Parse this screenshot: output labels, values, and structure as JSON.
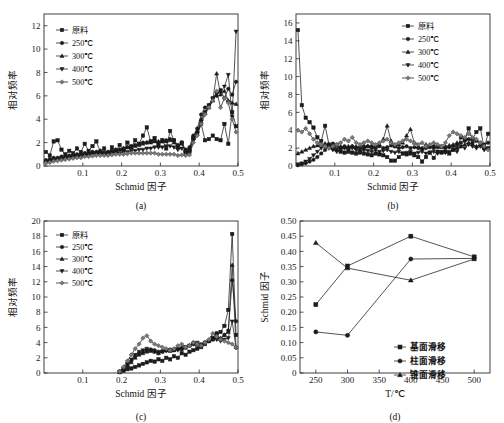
{
  "figure": {
    "panels": [
      "a",
      "b",
      "c",
      "d"
    ],
    "tags": {
      "a": "(a)",
      "b": "(b)",
      "c": "(c)",
      "d": "(d)"
    }
  },
  "labels": {
    "y_freq": "相对频率",
    "x_schmid": "Schmid 因子",
    "y_schmid": "Schmid 因子",
    "x_temp": "T/℃"
  },
  "legend_temp": [
    {
      "label": "原料",
      "marker": "square"
    },
    {
      "label": "250℃",
      "marker": "circle"
    },
    {
      "label": "300℃",
      "marker": "triangle"
    },
    {
      "label": "400℃",
      "marker": "down-triangle"
    },
    {
      "label": "500℃",
      "marker": "diamond"
    }
  ],
  "legend_slip": [
    {
      "label": "基面滑移",
      "marker": "square"
    },
    {
      "label": "柱面滑移",
      "marker": "circle"
    },
    {
      "label": "锥面滑移",
      "marker": "triangle"
    }
  ],
  "chart_data": [
    {
      "panel": "a",
      "type": "line",
      "title": "",
      "xlabel": "Schmid 因子",
      "ylabel": "相对频率",
      "xlim": [
        0,
        0.5
      ],
      "ylim": [
        0,
        13
      ],
      "xticks": [
        0.1,
        0.2,
        0.3,
        0.4,
        0.5
      ],
      "yticks": [
        0,
        2,
        4,
        6,
        8,
        10,
        12
      ],
      "grid": false,
      "legend_position": "top-left",
      "x": [
        0.005,
        0.015,
        0.025,
        0.035,
        0.045,
        0.055,
        0.065,
        0.075,
        0.085,
        0.095,
        0.105,
        0.115,
        0.125,
        0.135,
        0.145,
        0.155,
        0.165,
        0.175,
        0.185,
        0.195,
        0.205,
        0.215,
        0.225,
        0.235,
        0.245,
        0.255,
        0.265,
        0.275,
        0.285,
        0.295,
        0.305,
        0.315,
        0.325,
        0.335,
        0.345,
        0.355,
        0.365,
        0.375,
        0.385,
        0.395,
        0.405,
        0.415,
        0.425,
        0.435,
        0.445,
        0.455,
        0.465,
        0.475,
        0.485,
        0.495
      ],
      "series": [
        {
          "name": "原料",
          "marker": "square",
          "values": [
            1.2,
            0.9,
            2.1,
            2.2,
            1.4,
            1.0,
            1.3,
            1.1,
            1.5,
            1.2,
            1.9,
            1.3,
            1.7,
            2.1,
            1.2,
            1.5,
            1.1,
            1.6,
            1.3,
            1.8,
            1.4,
            2.0,
            1.6,
            2.2,
            1.9,
            2.6,
            3.3,
            2.1,
            2.4,
            1.8,
            2.2,
            1.5,
            3.0,
            2.2,
            1.6,
            2.0,
            1.1,
            1.2,
            2.4,
            2.8,
            3.6,
            2.2,
            2.3,
            2.6,
            2.3,
            2.2,
            3.6,
            1.9,
            4.6,
            3.4
          ]
        },
        {
          "name": "250℃",
          "marker": "circle",
          "values": [
            0.5,
            0.6,
            0.7,
            0.7,
            0.8,
            0.8,
            0.9,
            0.9,
            1.0,
            1.0,
            1.1,
            1.1,
            1.2,
            1.2,
            1.3,
            1.1,
            1.2,
            1.3,
            1.4,
            1.4,
            1.5,
            1.6,
            1.7,
            1.8,
            1.9,
            2.0,
            2.0,
            2.1,
            2.2,
            2.0,
            2.1,
            2.2,
            2.3,
            2.2,
            1.8,
            2.0,
            1.4,
            1.6,
            2.6,
            3.2,
            4.4,
            5.0,
            5.2,
            5.8,
            6.0,
            6.5,
            5.8,
            6.6,
            6.1,
            7.2
          ]
        },
        {
          "name": "300℃",
          "marker": "triangle",
          "values": [
            0.4,
            0.5,
            0.6,
            0.6,
            0.7,
            0.7,
            0.8,
            0.9,
            0.9,
            1.0,
            1.0,
            1.1,
            1.2,
            1.2,
            1.3,
            1.2,
            1.2,
            1.3,
            1.3,
            1.4,
            1.5,
            1.6,
            1.6,
            1.7,
            1.8,
            1.9,
            2.0,
            2.0,
            2.1,
            2.1,
            2.2,
            2.1,
            2.2,
            2.0,
            1.7,
            1.9,
            1.3,
            1.5,
            2.5,
            3.0,
            4.0,
            4.6,
            5.0,
            5.6,
            7.9,
            6.1,
            6.4,
            5.6,
            5.4,
            5.3
          ]
        },
        {
          "name": "400℃",
          "marker": "down-triangle",
          "values": [
            0.3,
            0.4,
            0.5,
            0.5,
            0.6,
            0.6,
            0.7,
            0.7,
            0.8,
            0.8,
            0.9,
            0.9,
            1.0,
            1.0,
            1.0,
            1.0,
            1.0,
            1.1,
            1.1,
            1.1,
            1.2,
            1.2,
            1.3,
            1.3,
            1.4,
            1.4,
            1.5,
            1.5,
            1.6,
            1.6,
            1.6,
            1.7,
            1.7,
            1.6,
            1.4,
            1.5,
            1.1,
            1.2,
            2.2,
            2.8,
            3.8,
            4.6,
            5.2,
            5.8,
            6.2,
            6.3,
            6.8,
            7.8,
            4.2,
            11.5
          ]
        },
        {
          "name": "500℃",
          "marker": "diamond",
          "values": [
            0.25,
            0.3,
            0.4,
            0.45,
            0.5,
            0.55,
            0.6,
            0.65,
            0.7,
            0.7,
            0.8,
            0.8,
            0.85,
            0.9,
            0.9,
            0.9,
            0.9,
            0.95,
            1.0,
            1.0,
            1.0,
            1.05,
            1.1,
            1.1,
            1.1,
            1.1,
            1.1,
            1.1,
            1.1,
            1.0,
            1.0,
            1.0,
            1.0,
            1.0,
            0.9,
            0.95,
            0.9,
            0.95,
            2.0,
            2.6,
            3.6,
            4.4,
            5.0,
            5.6,
            6.4,
            5.0,
            5.8,
            5.4,
            4.0,
            2.9
          ]
        }
      ]
    },
    {
      "panel": "b",
      "type": "line",
      "title": "",
      "xlabel": "Schmid 因子",
      "ylabel": "相对频率",
      "xlim": [
        0,
        0.5
      ],
      "ylim": [
        0,
        17
      ],
      "xticks": [
        0.1,
        0.2,
        0.3,
        0.4,
        0.5
      ],
      "yticks": [
        0,
        2,
        4,
        6,
        8,
        10,
        12,
        14,
        16
      ],
      "grid": false,
      "legend_position": "top-right",
      "x": [
        0.005,
        0.015,
        0.025,
        0.035,
        0.045,
        0.055,
        0.065,
        0.075,
        0.085,
        0.095,
        0.105,
        0.115,
        0.125,
        0.135,
        0.145,
        0.155,
        0.165,
        0.175,
        0.185,
        0.195,
        0.205,
        0.215,
        0.225,
        0.235,
        0.245,
        0.255,
        0.265,
        0.275,
        0.285,
        0.295,
        0.305,
        0.315,
        0.325,
        0.335,
        0.345,
        0.355,
        0.365,
        0.375,
        0.385,
        0.395,
        0.405,
        0.415,
        0.425,
        0.435,
        0.445,
        0.455,
        0.465,
        0.475,
        0.485,
        0.495
      ],
      "series": [
        {
          "name": "原料",
          "marker": "square",
          "values": [
            15.2,
            6.8,
            5.4,
            4.9,
            4.3,
            3.2,
            2.8,
            4.5,
            2.4,
            2.0,
            1.8,
            1.6,
            1.5,
            1.6,
            1.5,
            1.4,
            1.5,
            1.4,
            1.3,
            1.2,
            1.4,
            1.3,
            1.2,
            1.0,
            0.6,
            0.6,
            1.0,
            1.4,
            1.3,
            1.4,
            1.2,
            1.0,
            0.5,
            1.0,
            1.5,
            0.9,
            1.6,
            1.5,
            1.6,
            1.4,
            1.8,
            2.0,
            3.2,
            3.0,
            4.2,
            3.0,
            3.8,
            4.2,
            2.0,
            3.6
          ]
        },
        {
          "name": "250℃",
          "marker": "circle",
          "values": [
            0.1,
            0.2,
            0.3,
            0.5,
            0.7,
            1.0,
            1.4,
            1.8,
            2.2,
            2.5,
            2.4,
            2.0,
            2.2,
            2.0,
            2.2,
            2.1,
            1.9,
            2.0,
            2.2,
            2.0,
            2.1,
            2.2,
            2.0,
            2.1,
            2.3,
            2.2,
            2.0,
            2.1,
            2.2,
            2.0,
            2.1,
            2.0,
            1.9,
            2.0,
            2.1,
            2.0,
            2.1,
            2.2,
            2.0,
            2.1,
            2.2,
            2.4,
            2.6,
            2.8,
            3.0,
            2.6,
            2.8,
            2.6,
            2.4,
            2.6
          ]
        },
        {
          "name": "300℃",
          "marker": "triangle",
          "values": [
            1.4,
            1.6,
            1.8,
            2.0,
            2.2,
            2.3,
            2.4,
            2.5,
            2.4,
            2.3,
            2.2,
            2.2,
            2.1,
            2.2,
            2.2,
            2.1,
            2.2,
            2.3,
            2.2,
            2.3,
            2.2,
            2.4,
            3.0,
            4.5,
            2.8,
            2.2,
            2.4,
            2.6,
            3.4,
            4.1,
            2.6,
            2.2,
            2.0,
            2.4,
            2.2,
            2.3,
            2.2,
            2.1,
            2.2,
            2.3,
            2.4,
            2.6,
            2.2,
            2.4,
            2.6,
            2.4,
            2.2,
            2.4,
            2.2,
            2.0
          ]
        },
        {
          "name": "400℃",
          "marker": "down-triangle",
          "values": [
            0.2,
            0.3,
            0.5,
            0.8,
            1.2,
            1.6,
            2.0,
            2.2,
            2.0,
            1.8,
            1.6,
            1.8,
            2.0,
            1.8,
            2.0,
            1.8,
            1.6,
            1.8,
            1.7,
            1.6,
            1.8,
            1.6,
            1.7,
            1.8,
            1.6,
            1.5,
            1.6,
            1.4,
            1.5,
            1.6,
            1.4,
            1.5,
            1.6,
            1.4,
            1.5,
            1.6,
            1.4,
            1.6,
            1.5,
            1.6,
            1.8,
            1.6,
            2.2,
            2.0,
            2.4,
            2.2,
            2.0,
            2.2,
            1.8,
            2.0
          ]
        },
        {
          "name": "500℃",
          "marker": "diamond",
          "values": [
            4.0,
            3.8,
            4.2,
            3.6,
            3.0,
            2.6,
            2.4,
            2.2,
            2.0,
            2.2,
            2.4,
            2.6,
            3.0,
            2.8,
            3.2,
            2.6,
            2.4,
            2.6,
            2.8,
            2.6,
            2.4,
            2.6,
            2.8,
            3.0,
            2.6,
            2.4,
            2.6,
            2.8,
            3.0,
            2.8,
            2.6,
            2.4,
            2.6,
            2.2,
            2.4,
            2.6,
            2.4,
            2.2,
            2.6,
            3.4,
            3.8,
            3.6,
            3.4,
            3.2,
            3.6,
            3.2,
            3.0,
            2.6,
            2.2,
            1.8
          ]
        }
      ]
    },
    {
      "panel": "c",
      "type": "line",
      "title": "",
      "xlabel": "Schmid 因子",
      "ylabel": "相对频率",
      "xlim": [
        0,
        0.5
      ],
      "ylim": [
        0,
        20
      ],
      "xticks": [
        0.1,
        0.2,
        0.3,
        0.4,
        0.5
      ],
      "yticks": [
        0,
        2,
        4,
        6,
        8,
        10,
        12,
        14,
        16,
        18,
        20
      ],
      "grid": false,
      "legend_position": "top-left",
      "x": [
        0.195,
        0.205,
        0.215,
        0.225,
        0.235,
        0.245,
        0.255,
        0.265,
        0.275,
        0.285,
        0.295,
        0.305,
        0.315,
        0.325,
        0.335,
        0.345,
        0.355,
        0.365,
        0.375,
        0.385,
        0.395,
        0.405,
        0.415,
        0.425,
        0.435,
        0.445,
        0.455,
        0.465,
        0.475,
        0.485,
        0.495
      ],
      "series": [
        {
          "name": "原料",
          "marker": "square",
          "values": [
            0.1,
            0.3,
            0.5,
            0.6,
            0.8,
            1.0,
            1.2,
            1.4,
            1.6,
            1.5,
            1.8,
            1.6,
            2.0,
            1.8,
            2.2,
            2.0,
            2.6,
            2.4,
            2.8,
            3.0,
            3.2,
            3.4,
            3.8,
            4.2,
            4.6,
            5.2,
            5.4,
            6.2,
            8.3,
            18.3,
            5.0
          ]
        },
        {
          "name": "250℃",
          "marker": "circle",
          "values": [
            0.2,
            0.6,
            1.0,
            1.6,
            2.2,
            2.6,
            2.8,
            3.0,
            3.1,
            3.0,
            2.8,
            2.9,
            3.0,
            3.1,
            3.0,
            3.2,
            3.1,
            3.4,
            3.6,
            4.0,
            3.8,
            3.6,
            4.0,
            4.2,
            4.4,
            5.2,
            4.4,
            5.0,
            5.6,
            12.2,
            6.8
          ]
        },
        {
          "name": "300℃",
          "marker": "triangle",
          "values": [
            0.2,
            0.5,
            0.9,
            1.4,
            2.0,
            2.4,
            2.6,
            2.8,
            2.9,
            2.8,
            2.6,
            2.8,
            3.0,
            2.9,
            3.0,
            3.2,
            3.4,
            3.3,
            3.6,
            3.8,
            3.7,
            3.6,
            4.0,
            4.2,
            4.4,
            4.8,
            4.6,
            5.0,
            5.4,
            14.2,
            3.4
          ]
        },
        {
          "name": "400℃",
          "marker": "down-triangle",
          "values": [
            0.2,
            0.6,
            1.2,
            1.8,
            2.4,
            2.8,
            3.0,
            3.2,
            3.0,
            2.8,
            2.6,
            2.8,
            2.9,
            3.0,
            3.1,
            3.0,
            3.2,
            3.4,
            3.6,
            3.8,
            4.0,
            3.8,
            4.0,
            4.2,
            4.6,
            4.4,
            4.2,
            4.4,
            4.6,
            6.8,
            3.3
          ]
        },
        {
          "name": "500℃",
          "marker": "diamond",
          "values": [
            0.2,
            0.8,
            1.6,
            2.4,
            3.2,
            3.8,
            4.6,
            4.9,
            4.2,
            3.8,
            3.6,
            3.4,
            3.2,
            3.0,
            3.2,
            3.6,
            3.8,
            3.4,
            3.6,
            4.0,
            3.8,
            3.6,
            4.0,
            4.4,
            5.2,
            4.8,
            4.4,
            4.2,
            4.0,
            3.8,
            3.4
          ]
        }
      ]
    },
    {
      "panel": "d",
      "type": "line",
      "title": "",
      "xlabel": "T/℃",
      "ylabel": "Schmid 因子",
      "xlim": [
        225,
        525
      ],
      "ylim": [
        0,
        0.5
      ],
      "xticks": [
        250,
        300,
        350,
        400,
        450,
        500
      ],
      "yticks": [
        0,
        0.05,
        0.1,
        0.15,
        0.2,
        0.25,
        0.3,
        0.35,
        0.4,
        0.45,
        0.5
      ],
      "yticklabels": [
        "0",
        "0.05",
        "0.10",
        "0.15",
        "0.20",
        "0.25",
        "0.30",
        "0.35",
        "0.40",
        "0.45",
        "0.50"
      ],
      "grid": false,
      "legend_position": "bottom-right",
      "x": [
        250,
        300,
        400,
        500
      ],
      "series": [
        {
          "name": "基面滑移",
          "marker": "square",
          "values": [
            0.225,
            0.352,
            0.45,
            0.382
          ]
        },
        {
          "name": "柱面滑移",
          "marker": "circle",
          "values": [
            0.135,
            0.124,
            0.375,
            0.377
          ]
        },
        {
          "name": "锥面滑移",
          "marker": "triangle",
          "values": [
            0.428,
            0.345,
            0.305,
            0.375
          ]
        }
      ]
    }
  ]
}
